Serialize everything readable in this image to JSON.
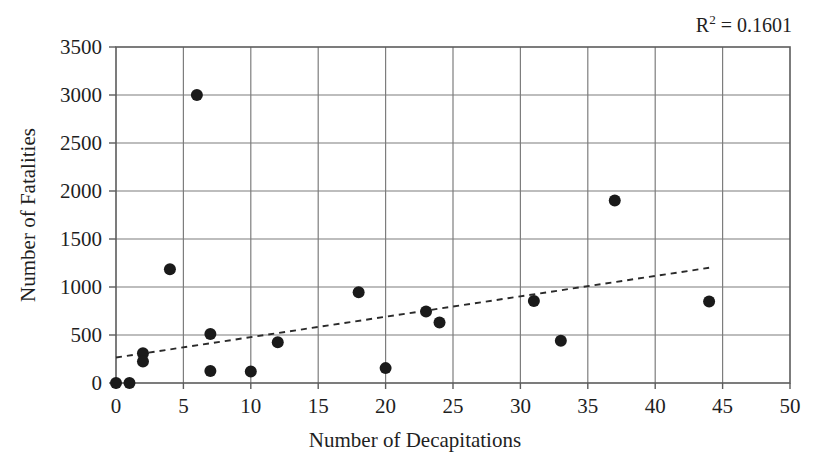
{
  "chart_data": {
    "type": "scatter",
    "title": "",
    "xlabel": "Number of Decapitations",
    "ylabel": "Number of Fatalities",
    "xlim": [
      0,
      50
    ],
    "ylim": [
      0,
      3500
    ],
    "xticks": [
      0,
      5,
      10,
      15,
      20,
      25,
      30,
      35,
      40,
      45,
      50
    ],
    "yticks": [
      0,
      500,
      1000,
      1500,
      2000,
      2500,
      3000,
      3500
    ],
    "xtick_labels": [
      "0",
      "5",
      "10",
      "15",
      "20",
      "25",
      "30",
      "35",
      "40",
      "45",
      "50"
    ],
    "ytick_labels": [
      "0",
      "500",
      "1000",
      "1500",
      "2000",
      "2500",
      "3000",
      "3500"
    ],
    "grid": true,
    "legend": "none",
    "annotations": [
      {
        "name": "r2-value",
        "text": "R2 = 0.1601",
        "r_label": "R",
        "exponent": "2",
        "equals_value": " = 0.1601"
      }
    ],
    "marker": {
      "shape": "circle",
      "color": "#1a1a1a",
      "size": 11
    },
    "points": [
      {
        "x": 0,
        "y": 0
      },
      {
        "x": 1,
        "y": 0
      },
      {
        "x": 2,
        "y": 310
      },
      {
        "x": 2,
        "y": 225
      },
      {
        "x": 4,
        "y": 1185
      },
      {
        "x": 6,
        "y": 3000
      },
      {
        "x": 7,
        "y": 510
      },
      {
        "x": 7,
        "y": 125
      },
      {
        "x": 10,
        "y": 120
      },
      {
        "x": 12,
        "y": 425
      },
      {
        "x": 18,
        "y": 945
      },
      {
        "x": 20,
        "y": 155
      },
      {
        "x": 23,
        "y": 745
      },
      {
        "x": 24,
        "y": 630
      },
      {
        "x": 31,
        "y": 855
      },
      {
        "x": 33,
        "y": 440
      },
      {
        "x": 37,
        "y": 1900
      },
      {
        "x": 44,
        "y": 850
      }
    ],
    "trendline": {
      "style": "dashed",
      "color": "#2a2a2a",
      "x_start": 0,
      "y_start": 265,
      "x_end": 44,
      "y_end": 1200
    },
    "colors": {
      "grid": "#7d7d7d",
      "axis": "#5c5c5c",
      "marker": "#1a1a1a",
      "trendline": "#2a2a2a",
      "text": "#1f1f1f",
      "background": "#ffffff"
    }
  }
}
